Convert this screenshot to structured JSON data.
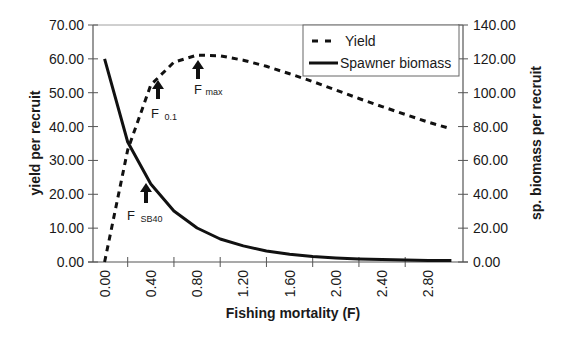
{
  "chart_data": {
    "type": "line",
    "title": "",
    "xlabel": "Fishing mortality (F)",
    "ylabel": "yield per recruit",
    "y2label": "sp. biomass per recruit",
    "x": [
      0.0,
      0.2,
      0.4,
      0.6,
      0.8,
      1.0,
      1.2,
      1.4,
      1.6,
      1.8,
      2.0,
      2.2,
      2.4,
      2.6,
      2.8,
      3.0
    ],
    "x_tick_labels": [
      "0.00",
      "0.40",
      "0.80",
      "1.20",
      "1.60",
      "2.00",
      "2.40",
      "2.80"
    ],
    "ylim": [
      0,
      70
    ],
    "y_ticks": [
      "0.00",
      "10.00",
      "20.00",
      "30.00",
      "40.00",
      "50.00",
      "60.00",
      "70.00"
    ],
    "y2lim": [
      0,
      140
    ],
    "y2_ticks": [
      "0.00",
      "20.00",
      "40.00",
      "60.00",
      "80.00",
      "100.00",
      "120.00",
      "140.00"
    ],
    "grid": false,
    "legend_position": "upper right",
    "series": [
      {
        "name": "Yield",
        "axis": "left",
        "style": "dashed",
        "values": [
          0.0,
          33.1,
          52.3,
          59.0,
          61.1,
          60.9,
          59.6,
          57.8,
          55.6,
          53.3,
          50.8,
          48.3,
          45.9,
          43.6,
          41.3,
          39.3
        ]
      },
      {
        "name": "Spawner biomass",
        "axis": "right",
        "style": "solid",
        "values": [
          120.0,
          70.9,
          46.1,
          30.1,
          20.1,
          13.6,
          9.5,
          6.5,
          4.6,
          3.3,
          2.4,
          1.8,
          1.4,
          1.1,
          0.9,
          0.8
        ]
      }
    ],
    "annotations": [
      {
        "label": "F",
        "sub": "0.1",
        "x": 0.45,
        "target_series": "Yield"
      },
      {
        "label": "F",
        "sub": "max",
        "x": 0.8,
        "target_series": "Yield"
      },
      {
        "label": "F",
        "sub": "SB40",
        "x": 0.35,
        "target_series": "Spawner biomass"
      }
    ]
  },
  "legend": {
    "items": [
      {
        "label": "Yield",
        "style": "dashed"
      },
      {
        "label": "Spawner biomass",
        "style": "solid"
      }
    ]
  },
  "colors": {
    "line": "#111111",
    "axis": "#555555",
    "background": "#ffffff"
  }
}
